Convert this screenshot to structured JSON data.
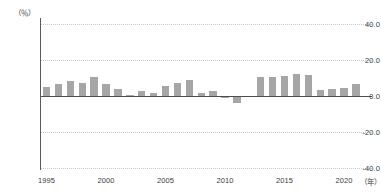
{
  "chart_data": {
    "type": "bar",
    "title": "",
    "xlabel": "(年)",
    "ylabel": "(％)",
    "ylim": [
      -40.0,
      40.0
    ],
    "yticks": [
      "40.0",
      "20.0",
      "0.0",
      "-20.0",
      "-40.0"
    ],
    "ytick_values": [
      40.0,
      20.0,
      0.0,
      -20.0,
      -40.0
    ],
    "xticks": [
      "1995",
      "2000",
      "2005",
      "2010",
      "2015",
      "2020"
    ],
    "xtick_values": [
      1995,
      2000,
      2005,
      2010,
      2015,
      2020
    ],
    "grid": true,
    "legend": "none",
    "bar_color": "#a6a6a6",
    "axis_color": "#5a5a5a",
    "zero_line_color": "#4d4d4d",
    "grid_color": "#c9c9c9",
    "categories": [
      1995,
      1996,
      1997,
      1998,
      1999,
      2000,
      2001,
      2002,
      2003,
      2004,
      2005,
      2006,
      2007,
      2008,
      2009,
      2010,
      2011,
      2013,
      2014,
      2015,
      2016,
      2017,
      2018,
      2019,
      2020,
      2021
    ],
    "values": [
      4.8,
      6.5,
      8.6,
      7.2,
      10.6,
      6.7,
      4.0,
      0.4,
      2.9,
      1.5,
      5.7,
      7.5,
      8.9,
      1.6,
      3.0,
      -1.2,
      -3.8,
      10.6,
      10.4,
      11.2,
      12.4,
      11.6,
      3.4,
      3.7,
      4.6,
      6.6
    ]
  },
  "axis": {
    "y_unit": "（％）",
    "x_unit": "（年）"
  }
}
